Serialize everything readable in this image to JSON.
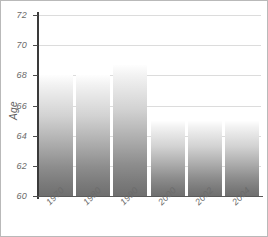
{
  "chart_data": {
    "type": "bar",
    "title": "",
    "subtitle": "",
    "xlabel": "",
    "ylabel": "Age",
    "categories": [
      "1970",
      "1980",
      "1990",
      "2000",
      "2002",
      "2004"
    ],
    "values": [
      68.0,
      68.0,
      68.7,
      65.0,
      65.0,
      65.0
    ],
    "series": [
      {
        "name": "Age",
        "values": [
          68.0,
          68.0,
          68.7,
          65.0,
          65.0,
          65.0
        ]
      }
    ],
    "ylim": [
      60,
      72
    ],
    "yticks": [
      60,
      62,
      64,
      66,
      68,
      70,
      72
    ],
    "ytick_labels": [
      "60",
      "62",
      "64",
      "66",
      "68",
      "70",
      "72"
    ],
    "xtick_labels": [
      "1970",
      "1980",
      "1990",
      "2000",
      "2002",
      "2004"
    ],
    "grid": true,
    "grid_axis": "y",
    "legend": false,
    "legend_position": "none",
    "bar_style": "vertical-gradient",
    "annotations": []
  },
  "colors": {
    "background": "#ffffff",
    "border": "#b9b9b9",
    "gridline": "#dcdcdc",
    "axis_spine": "#3a3a3a",
    "tick_text": "#6b6b6b",
    "axis_title": "#5e5e5e",
    "bar_top": "#fefefe",
    "bar_bottom": "#6f6f6f"
  }
}
